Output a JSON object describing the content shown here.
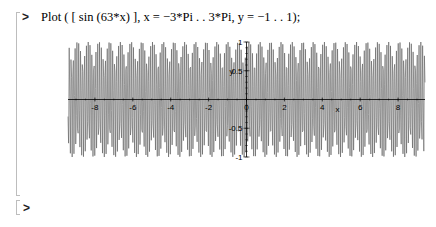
{
  "worksheet": {
    "input_prompt": ">",
    "command": "Plot ( [ sin (63*x) ], x = −3*Pi . . 3*Pi, y = −1 . . 1);",
    "next_prompt": ">"
  },
  "chart_data": {
    "type": "line",
    "title": "",
    "expression": "sin(63*x)",
    "xlabel": "x",
    "ylabel": "y",
    "xlim": [
      -9.42,
      9.42
    ],
    "ylim": [
      -1,
      1
    ],
    "x_ticks": [
      -8,
      -6,
      -4,
      -2,
      0,
      2,
      4,
      6,
      8
    ],
    "x_tick_labels": [
      "-8",
      "-6",
      "-4",
      "-2",
      "0",
      "2",
      "4",
      "6",
      "8"
    ],
    "y_ticks": [
      -1,
      -0.5,
      0.5,
      1
    ],
    "y_tick_labels": [
      "-1",
      "-0.5",
      "0.5",
      "1"
    ],
    "samples": 600,
    "line_color": "#5a5a5a",
    "axis_color": "#000000",
    "grid": false,
    "legend": false,
    "note": "aliased plot of a high-frequency sine sampled across [-3π, 3π]"
  }
}
